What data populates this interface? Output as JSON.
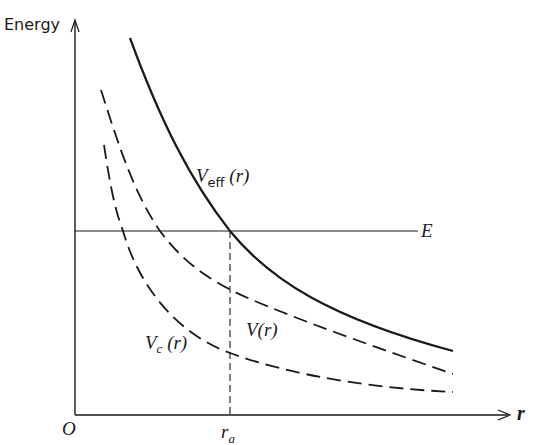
{
  "axes": {
    "y_label": "Energy",
    "x_label": "r",
    "origin_label": "O",
    "tick_label_base": "r",
    "tick_label_sub": "a"
  },
  "lines": {
    "energy_label": "E"
  },
  "curves": {
    "veff": {
      "base": "V",
      "sub": "eff",
      "arg": " (r)",
      "style": "solid"
    },
    "v": {
      "base": "V",
      "arg": "(r)",
      "style": "dashed"
    },
    "vc": {
      "base": "V",
      "sub": "c",
      "arg": " (r)",
      "style": "dashed"
    }
  },
  "colors": {
    "ink": "#1a1a1a",
    "background": "#ffffff"
  }
}
